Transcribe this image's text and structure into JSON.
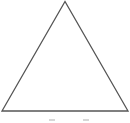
{
  "diagram": {
    "shape": "triangle",
    "kind": "equilateral-outline",
    "stroke_color": "#555555",
    "fill_color": "#ffffff",
    "stroke_width": 1.3,
    "vertices": {
      "apex": [
        65,
        1.5
      ],
      "bottom_left": [
        2,
        111
      ],
      "bottom_right": [
        128,
        111
      ]
    }
  }
}
